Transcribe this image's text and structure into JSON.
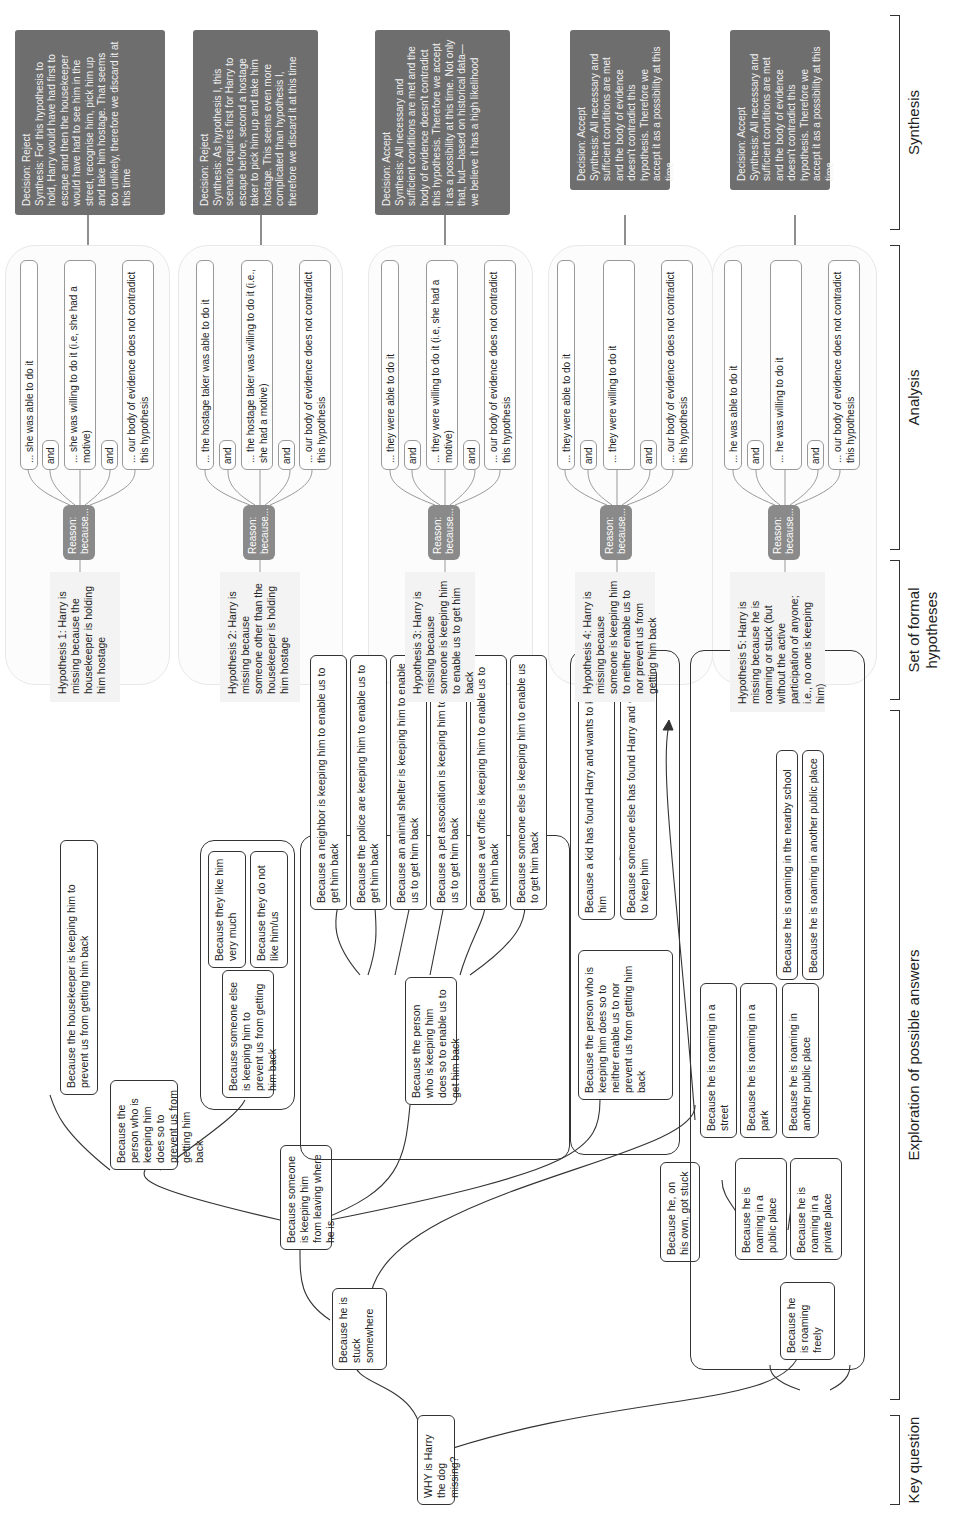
{
  "key_question": "WHY is Harry the dog missing?",
  "sections": [
    {
      "id": "key",
      "label": "Key question"
    },
    {
      "id": "exploration",
      "label": "Exploration of possible answers"
    },
    {
      "id": "hypotheses",
      "label": "Set of formal hypotheses"
    },
    {
      "id": "analysis",
      "label": "Analysis"
    },
    {
      "id": "synthesis",
      "label": "Synthesis"
    }
  ],
  "exploration": {
    "stuck": "Because he is stuck somewhere",
    "someone_keeping": "Because someone is keeping him from leaving where he is",
    "prevent": "Because the person who is keeping him does so to prevent us from getting him back",
    "housekeeper": "Because the housekeeper is keeping him to prevent us from getting him back",
    "someone_else_prevent": "Because someone else is keeping him to prevent us from getting him back",
    "like_him": "Because they like him very much",
    "dislike_him": "Because they do not like him/us",
    "enable": "Because the person who is keeping him does so to enable us to get him back",
    "enable_children": [
      "Because a neighbor is keeping him to enable us to get him back",
      "Because the police are keeping him to enable us to get him back",
      "Because an animal shelter is keeping him to enable us to get him back",
      "Because a pet association is keeping him to enable us to get him back",
      "Because a vet office is keeping him to enable us to get him back",
      "Because someone else is keeping him to enable us to get him back"
    ],
    "neither": "Because the person who is keeping him does so to neither enable us to nor prevent us from getting him back",
    "neither_children": [
      "Because a kid has found Harry and wants to keep him",
      "Because someone else has found Harry and wants to keep him"
    ],
    "own_stuck": "Because he, on his own, got stuck",
    "roaming": "Because he is roaming freely",
    "public_place": "Because he is roaming in a public place",
    "private_place": "Because he is roaming in a private place",
    "street": "Because he is roaming in a street",
    "park": "Because he is roaming in a park",
    "another_public": "Because he is roaming in another public place",
    "nearby_school": "Because he is roaming in the nearby school",
    "another_public_2": "Because he is roaming in another public place"
  },
  "hypotheses": [
    {
      "text": "Hypothesis 1: Harry is missing because the housekeeper is holding him hostage",
      "reason": "Reason: because...",
      "conditions": [
        "... she was able to do it",
        "... she was willing to do it (i.e, she had a motive)",
        "... our body of evidence does not contradict this hypothesis"
      ],
      "decision": "Decision: Reject",
      "synthesis": "Synthesis: For this hypothesis to hold, Harry would have had first to escape and then the housekeeper would have had to see him in the street, recognise him, pick him up and take him hostage. That seems too unlikely, therefore we discard it at this time"
    },
    {
      "text": "Hypothesis 2: Harry is missing because someone other than the housekeeper is holding him hostage",
      "reason": "Reason: because...",
      "conditions": [
        "... the hostage taker was able to do it",
        "... the hostage taker was willing to do it (i.e., she had a motive)",
        "... our body of evidence does not contradict this hypothesis"
      ],
      "decision": "Decision: Reject",
      "synthesis": "Synthesis: As hypothesis I, this scenario requires first for Harry to escape before, second a hostage taker to pick him up and take him hostage. This seems even more complicated than hypothesis I, therefore we discard it at this time"
    },
    {
      "text": "Hypothesis 3: Harry is missing because someone is keeping him to enable us to get him back",
      "reason": "Reason: because...",
      "conditions": [
        "... they were able to do it",
        "... they were willing to do it (i.e, she had a motive)",
        "... our body of evidence does not contradict this hypothesis"
      ],
      "decision": "Decision: Accept",
      "synthesis": "Synthesis: All necessary and sufficient conditions are met and the body of evidence doesn't contradict this hypothesis. Therefore we accept it as a possibility at this time. Not only that, but—based on historical data—we believe it has a high likelihood"
    },
    {
      "text": "Hypothesis 4: Harry is missing because someone is keeping him to neither enable us to nor prevent us from getting him back",
      "reason": "Reason: because...",
      "conditions": [
        "... they were able to do it",
        "... they were willing to do it",
        "... our body of evidence does not contradict this hypothesis"
      ],
      "decision": "Decision: Accept",
      "synthesis": "Synthesis: All necessary and sufficient conditions are met and the body of evidence doesn't contradict this hypothesis. Therefore we accept it as a possibility at this time"
    },
    {
      "text": "Hypothesis 5: Harry is missing because he is roaming or stuck (but without the active participation of anyone; i.e., no one is keeping him)",
      "reason": "Reason: because...",
      "conditions": [
        "... he was able to do it",
        "... he was willing to do it",
        "... our body of evidence does not contradict this hypothesis"
      ],
      "decision": "Decision: Accept",
      "synthesis": "Synthesis: All necessary and sufficient conditions are met and the body of evidence doesn't contradict this hypothesis. Therefore we accept it as a possibility at this time"
    }
  ],
  "and_label": "and"
}
